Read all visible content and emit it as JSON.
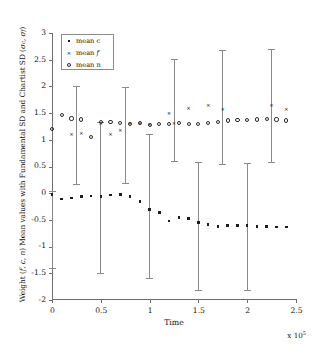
{
  "chart_data": {
    "type": "scatter",
    "title": "",
    "xlabel": "Time",
    "ylabel": "Weight (f, c, n) Mean values with Fundamental SD and Chartist SD (σc, σf)",
    "ylabel_parts": {
      "prefix": "Weight (",
      "vars": "f, c, n",
      "middle": ") Mean values with Fundamental SD and Chartist SD (",
      "sigma_c": "σ",
      "sub_c": "c",
      "comma": ", ",
      "sigma_f": "σ",
      "sub_f": "f",
      "suffix": ")"
    },
    "x_multiplier": "x 10",
    "x_multiplier_exponent": "5",
    "xlim": [
      0,
      2.5
    ],
    "ylim": [
      -2,
      3
    ],
    "xticks": [
      0,
      0.5,
      1,
      1.5,
      2,
      2.5
    ],
    "xtick_labels": [
      "0",
      "0.5",
      "1",
      "1.5",
      "2",
      "2.5"
    ],
    "yticks": [
      -2,
      -1.5,
      -1,
      -0.5,
      0,
      0.5,
      1,
      1.5,
      2,
      2.5,
      3
    ],
    "ytick_labels": [
      "-2",
      "-1.5",
      "-1",
      "-0.5",
      "0",
      "0.5",
      "1",
      "1.5",
      "2",
      "2.5",
      "3"
    ],
    "grid": false,
    "legend_position": "upper left",
    "series": [
      {
        "name": "mean c",
        "marker": "square-dot",
        "x": [
          0,
          0.1,
          0.2,
          0.3,
          0.4,
          0.5,
          0.6,
          0.7,
          0.8,
          0.9,
          1.0,
          1.1,
          1.2,
          1.3,
          1.4,
          1.5,
          1.6,
          1.7,
          1.8,
          1.9,
          2.0,
          2.1,
          2.2,
          2.3,
          2.4
        ],
        "values": [
          -0.02,
          -0.11,
          -0.09,
          -0.06,
          -0.05,
          -0.06,
          -0.03,
          -0.02,
          -0.06,
          -0.16,
          -0.31,
          -0.36,
          -0.52,
          -0.46,
          -0.47,
          -0.55,
          -0.59,
          -0.62,
          -0.61,
          -0.61,
          -0.61,
          -0.62,
          -0.62,
          -0.63,
          -0.63
        ],
        "error_x": [
          0,
          0.5,
          1.0,
          1.5,
          2.0
        ],
        "error_y": [
          -0.02,
          -0.06,
          -0.31,
          -0.55,
          -0.61
        ],
        "error_lower": [
          -1.4,
          -1.49,
          -1.59,
          -1.81,
          -1.81
        ],
        "error_upper": [
          0.04,
          1.34,
          1.11,
          0.59,
          0.56
        ]
      },
      {
        "name": "mean f",
        "marker": "x",
        "x": [
          0.2,
          0.3,
          0.5,
          0.6,
          0.7,
          0.8,
          0.9,
          1.0,
          1.2,
          1.25,
          1.4,
          1.6,
          1.75,
          2.25,
          2.4
        ],
        "values": [
          1.1,
          1.11,
          1.31,
          1.1,
          1.18,
          1.3,
          1.3,
          1.28,
          1.5,
          1.31,
          1.59,
          1.64,
          1.56,
          1.65,
          1.57
        ],
        "error_x": [
          0.25,
          0.75,
          1.25,
          1.75,
          2.25
        ],
        "error_y": [
          1.1,
          1.3,
          1.31,
          1.56,
          1.65
        ],
        "error_lower": [
          0.17,
          0.19,
          0.61,
          0.54,
          0.58
        ],
        "error_upper": [
          2.01,
          1.98,
          2.52,
          2.68,
          2.7
        ]
      },
      {
        "name": "mean n",
        "marker": "circle",
        "x": [
          0,
          0.1,
          0.2,
          0.3,
          0.4,
          0.5,
          0.6,
          0.7,
          0.8,
          0.9,
          1.0,
          1.1,
          1.2,
          1.3,
          1.4,
          1.5,
          1.6,
          1.7,
          1.8,
          1.9,
          2.0,
          2.1,
          2.2,
          2.3,
          2.4
        ],
        "values": [
          1.2,
          1.46,
          1.4,
          1.38,
          1.05,
          1.34,
          1.33,
          1.31,
          1.29,
          1.31,
          1.27,
          1.3,
          1.29,
          1.31,
          1.3,
          1.3,
          1.32,
          1.34,
          1.36,
          1.37,
          1.37,
          1.38,
          1.39,
          1.38,
          1.36
        ]
      }
    ],
    "legend": [
      {
        "label": "mean c",
        "symbol": "square"
      },
      {
        "label": "mean f",
        "symbol": "x",
        "italic_tail": "f"
      },
      {
        "label": "mean n",
        "symbol": "circle"
      }
    ]
  }
}
